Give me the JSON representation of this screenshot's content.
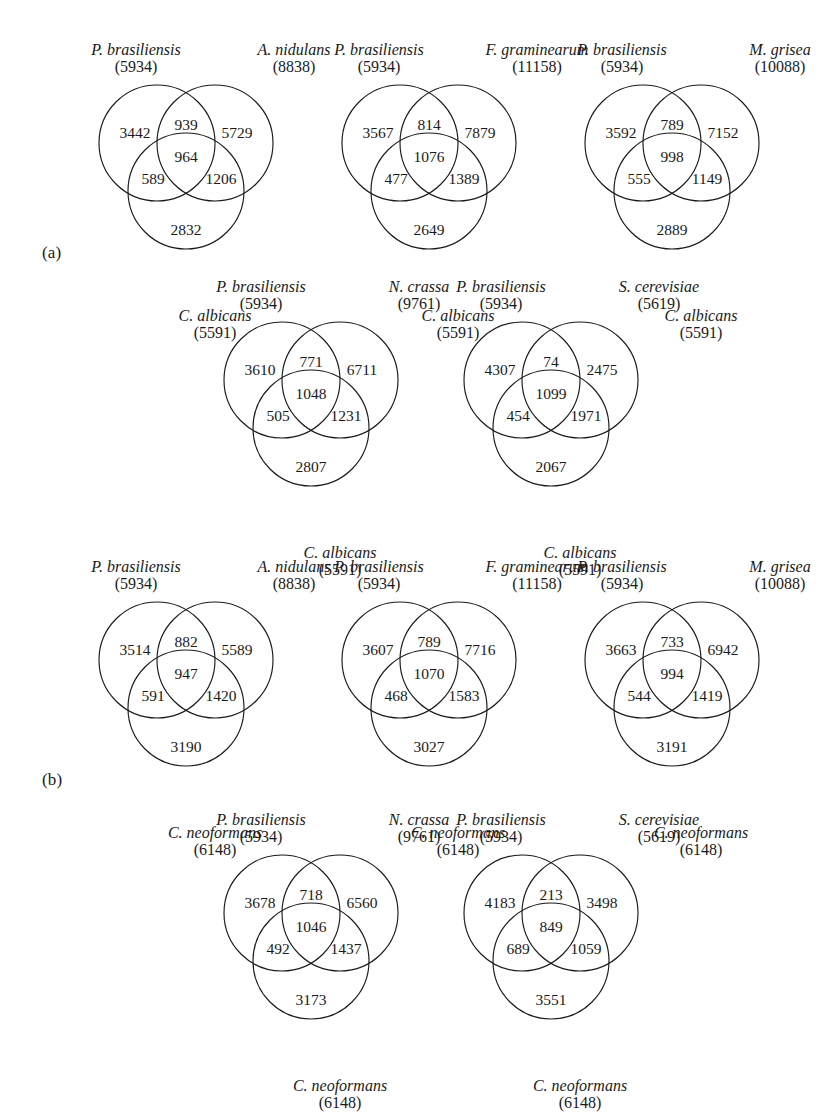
{
  "figure": {
    "background_color": "#ffffff",
    "stroke_color": "#1a1a1a",
    "text_color": "#1a1a1a"
  },
  "panels": [
    {
      "id": "a",
      "label": "(a)"
    },
    {
      "id": "b",
      "label": "(b)"
    }
  ],
  "chart_data": {
    "type": "diagram",
    "subtype": "venn3",
    "title": "",
    "diagrams": [
      {
        "panel": "a",
        "row": 1,
        "col": 1,
        "sets": [
          {
            "position": "top-left",
            "name": "P. brasiliensis",
            "total": "(5934)",
            "total_value": 5934
          },
          {
            "position": "top-right",
            "name": "A. nidulans",
            "total": "(8838)",
            "total_value": 8838
          },
          {
            "position": "bottom",
            "name": "C. albicans",
            "total": "(5591)",
            "total_value": 5591
          }
        ],
        "regions": {
          "left_only": "3442",
          "right_only": "5729",
          "bottom_only": "2832",
          "left_right": "939",
          "left_bottom": "589",
          "right_bottom": "1206",
          "center": "964"
        }
      },
      {
        "panel": "a",
        "row": 1,
        "col": 2,
        "sets": [
          {
            "position": "top-left",
            "name": "P. brasiliensis",
            "total": "(5934)",
            "total_value": 5934
          },
          {
            "position": "top-right",
            "name": "F. graminearum",
            "total": "(11158)",
            "total_value": 11158
          },
          {
            "position": "bottom",
            "name": "C. albicans",
            "total": "(5591)",
            "total_value": 5591
          }
        ],
        "regions": {
          "left_only": "3567",
          "right_only": "7879",
          "bottom_only": "2649",
          "left_right": "814",
          "left_bottom": "477",
          "right_bottom": "1389",
          "center": "1076"
        }
      },
      {
        "panel": "a",
        "row": 1,
        "col": 3,
        "sets": [
          {
            "position": "top-left",
            "name": "P. brasiliensis",
            "total": "(5934)",
            "total_value": 5934
          },
          {
            "position": "top-right",
            "name": "M. grisea",
            "total": "(10088)",
            "total_value": 10088
          },
          {
            "position": "bottom",
            "name": "C. albicans",
            "total": "(5591)",
            "total_value": 5591
          }
        ],
        "regions": {
          "left_only": "3592",
          "right_only": "7152",
          "bottom_only": "2889",
          "left_right": "789",
          "left_bottom": "555",
          "right_bottom": "1149",
          "center": "998"
        }
      },
      {
        "panel": "a",
        "row": 2,
        "col": 1,
        "sets": [
          {
            "position": "top-left",
            "name": "P. brasiliensis",
            "total": "(5934)",
            "total_value": 5934
          },
          {
            "position": "top-right",
            "name": "N. crassa",
            "total": "(9761)",
            "total_value": 9761
          },
          {
            "position": "bottom",
            "name": "C. albicans",
            "total": "(5591)",
            "total_value": 5591
          }
        ],
        "regions": {
          "left_only": "3610",
          "right_only": "6711",
          "bottom_only": "2807",
          "left_right": "771",
          "left_bottom": "505",
          "right_bottom": "1231",
          "center": "1048"
        }
      },
      {
        "panel": "a",
        "row": 2,
        "col": 2,
        "sets": [
          {
            "position": "top-left",
            "name": "P. brasiliensis",
            "total": "(5934)",
            "total_value": 5934
          },
          {
            "position": "top-right",
            "name": "S. cerevisiae",
            "total": "(5619)",
            "total_value": 5619
          },
          {
            "position": "bottom",
            "name": "C. albicans",
            "total": "(5591)",
            "total_value": 5591
          }
        ],
        "regions": {
          "left_only": "4307",
          "right_only": "2475",
          "bottom_only": "2067",
          "left_right": "74",
          "left_bottom": "454",
          "right_bottom": "1971",
          "center": "1099"
        }
      },
      {
        "panel": "b",
        "row": 1,
        "col": 1,
        "sets": [
          {
            "position": "top-left",
            "name": "P. brasiliensis",
            "total": "(5934)",
            "total_value": 5934
          },
          {
            "position": "top-right",
            "name": "A. nidulans",
            "total": "(8838)",
            "total_value": 8838
          },
          {
            "position": "bottom",
            "name": "C. neoformans",
            "total": "(6148)",
            "total_value": 6148
          }
        ],
        "regions": {
          "left_only": "3514",
          "right_only": "5589",
          "bottom_only": "3190",
          "left_right": "882",
          "left_bottom": "591",
          "right_bottom": "1420",
          "center": "947"
        }
      },
      {
        "panel": "b",
        "row": 1,
        "col": 2,
        "sets": [
          {
            "position": "top-left",
            "name": "P. brasiliensis",
            "total": "(5934)",
            "total_value": 5934
          },
          {
            "position": "top-right",
            "name": "F. graminearum",
            "total": "(11158)",
            "total_value": 11158
          },
          {
            "position": "bottom",
            "name": "C. neoformans",
            "total": "(6148)",
            "total_value": 6148
          }
        ],
        "regions": {
          "left_only": "3607",
          "right_only": "7716",
          "bottom_only": "3027",
          "left_right": "789",
          "left_bottom": "468",
          "right_bottom": "1583",
          "center": "1070"
        }
      },
      {
        "panel": "b",
        "row": 1,
        "col": 3,
        "sets": [
          {
            "position": "top-left",
            "name": "P. brasiliensis",
            "total": "(5934)",
            "total_value": 5934
          },
          {
            "position": "top-right",
            "name": "M. grisea",
            "total": "(10088)",
            "total_value": 10088
          },
          {
            "position": "bottom",
            "name": "C. neoformans",
            "total": "(6148)",
            "total_value": 6148
          }
        ],
        "regions": {
          "left_only": "3663",
          "right_only": "6942",
          "bottom_only": "3191",
          "left_right": "733",
          "left_bottom": "544",
          "right_bottom": "1419",
          "center": "994"
        }
      },
      {
        "panel": "b",
        "row": 2,
        "col": 1,
        "sets": [
          {
            "position": "top-left",
            "name": "P. brasiliensis",
            "total": "(5934)",
            "total_value": 5934
          },
          {
            "position": "top-right",
            "name": "N. crassa",
            "total": "(9761)",
            "total_value": 9761
          },
          {
            "position": "bottom",
            "name": "C. neoformans",
            "total": "(6148)",
            "total_value": 6148
          }
        ],
        "regions": {
          "left_only": "3678",
          "right_only": "6560",
          "bottom_only": "3173",
          "left_right": "718",
          "left_bottom": "492",
          "right_bottom": "1437",
          "center": "1046"
        }
      },
      {
        "panel": "b",
        "row": 2,
        "col": 2,
        "sets": [
          {
            "position": "top-left",
            "name": "P. brasiliensis",
            "total": "(5934)",
            "total_value": 5934
          },
          {
            "position": "top-right",
            "name": "S. cerevisiae",
            "total": "(5619)",
            "total_value": 5619
          },
          {
            "position": "bottom",
            "name": "C. neoformans",
            "total": "(6148)",
            "total_value": 6148
          }
        ],
        "regions": {
          "left_only": "4183",
          "right_only": "3498",
          "bottom_only": "3551",
          "left_right": "213",
          "left_bottom": "689",
          "right_bottom": "1059",
          "center": "849"
        }
      }
    ]
  }
}
